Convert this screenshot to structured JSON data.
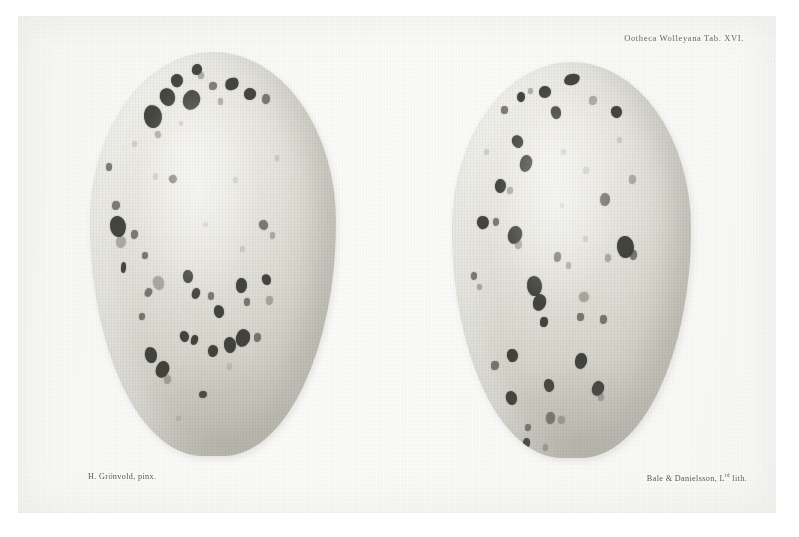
{
  "plate": {
    "title_caption": "Ootheca Wolleyana Tab. XVI.",
    "artist_caption": "H. Grönvold, pinx.",
    "printer_caption_main": "Bale & Danielsson, L",
    "printer_caption_sup": "td",
    "printer_caption_tail": " lith.",
    "background_color": "#ffffff",
    "paper_color": "#f7f7f5",
    "shell_color": "#e4e3dc",
    "spot_color": "#2b2a26"
  },
  "specimens": [
    {
      "name": "egg-left",
      "left": 90,
      "top": 52,
      "width": 246,
      "height": 404,
      "spots": [
        {
          "x": 33.0,
          "y": 5.5,
          "w": 5.0,
          "h": 3.2,
          "r": -18,
          "cls": ""
        },
        {
          "x": 41.5,
          "y": 3.0,
          "w": 4.0,
          "h": 2.6,
          "r": 12,
          "cls": ""
        },
        {
          "x": 28.5,
          "y": 9.0,
          "w": 6.2,
          "h": 4.4,
          "r": -25,
          "cls": ""
        },
        {
          "x": 38.0,
          "y": 9.5,
          "w": 7.0,
          "h": 5.0,
          "r": 15,
          "cls": ""
        },
        {
          "x": 48.5,
          "y": 7.5,
          "w": 3.0,
          "h": 2.0,
          "r": 0,
          "cls": "mid"
        },
        {
          "x": 22.0,
          "y": 13.0,
          "w": 7.5,
          "h": 5.8,
          "r": -10,
          "cls": ""
        },
        {
          "x": 55.0,
          "y": 6.5,
          "w": 5.5,
          "h": 3.0,
          "r": -22,
          "cls": "streak"
        },
        {
          "x": 62.5,
          "y": 9.0,
          "w": 5.0,
          "h": 3.0,
          "r": 8,
          "cls": ""
        },
        {
          "x": 70.0,
          "y": 10.5,
          "w": 3.2,
          "h": 2.4,
          "r": 0,
          "cls": "mid"
        },
        {
          "x": 44.0,
          "y": 5.0,
          "w": 2.2,
          "h": 1.6,
          "r": 0,
          "cls": "soft"
        },
        {
          "x": 52.0,
          "y": 11.5,
          "w": 2.0,
          "h": 1.5,
          "r": 0,
          "cls": "soft"
        },
        {
          "x": 36.0,
          "y": 17.0,
          "w": 2.0,
          "h": 1.4,
          "r": 0,
          "cls": "faint"
        },
        {
          "x": 26.5,
          "y": 19.5,
          "w": 2.6,
          "h": 1.8,
          "r": -20,
          "cls": "soft"
        },
        {
          "x": 6.5,
          "y": 27.5,
          "w": 2.6,
          "h": 2.0,
          "r": 0,
          "cls": "mid"
        },
        {
          "x": 75.0,
          "y": 25.5,
          "w": 2.0,
          "h": 1.6,
          "r": 0,
          "cls": "faint"
        },
        {
          "x": 9.0,
          "y": 37.0,
          "w": 3.0,
          "h": 2.2,
          "r": 0,
          "cls": "mid"
        },
        {
          "x": 8.0,
          "y": 40.5,
          "w": 6.5,
          "h": 5.2,
          "r": -12,
          "cls": ""
        },
        {
          "x": 10.5,
          "y": 45.5,
          "w": 4.0,
          "h": 3.0,
          "r": 0,
          "cls": "soft"
        },
        {
          "x": 16.5,
          "y": 44.0,
          "w": 3.0,
          "h": 2.4,
          "r": 0,
          "cls": "mid"
        },
        {
          "x": 25.5,
          "y": 30.0,
          "w": 2.0,
          "h": 1.6,
          "r": 0,
          "cls": "faint"
        },
        {
          "x": 32.0,
          "y": 30.5,
          "w": 3.2,
          "h": 2.0,
          "r": -30,
          "cls": "mid"
        },
        {
          "x": 58.0,
          "y": 31.0,
          "w": 2.0,
          "h": 1.5,
          "r": 0,
          "cls": "faint"
        },
        {
          "x": 68.5,
          "y": 41.5,
          "w": 3.6,
          "h": 2.4,
          "r": -35,
          "cls": "mid"
        },
        {
          "x": 73.0,
          "y": 44.5,
          "w": 2.2,
          "h": 1.8,
          "r": 0,
          "cls": "soft"
        },
        {
          "x": 21.0,
          "y": 49.5,
          "w": 2.4,
          "h": 1.8,
          "r": 0,
          "cls": "mid"
        },
        {
          "x": 12.5,
          "y": 52.0,
          "w": 2.2,
          "h": 2.6,
          "r": 0,
          "cls": "streak"
        },
        {
          "x": 25.5,
          "y": 55.5,
          "w": 4.4,
          "h": 3.4,
          "r": -20,
          "cls": "soft"
        },
        {
          "x": 22.5,
          "y": 58.5,
          "w": 3.0,
          "h": 2.2,
          "r": 20,
          "cls": "mid"
        },
        {
          "x": 38.0,
          "y": 54.0,
          "w": 4.0,
          "h": 3.2,
          "r": -8,
          "cls": ""
        },
        {
          "x": 41.5,
          "y": 58.5,
          "w": 3.4,
          "h": 2.6,
          "r": 15,
          "cls": ""
        },
        {
          "x": 48.0,
          "y": 59.5,
          "w": 2.6,
          "h": 2.0,
          "r": 0,
          "cls": "mid"
        },
        {
          "x": 50.5,
          "y": 62.5,
          "w": 4.2,
          "h": 3.2,
          "r": -14,
          "cls": ""
        },
        {
          "x": 59.5,
          "y": 56.0,
          "w": 4.4,
          "h": 3.6,
          "r": 0,
          "cls": ""
        },
        {
          "x": 62.5,
          "y": 61.0,
          "w": 2.4,
          "h": 1.8,
          "r": 0,
          "cls": "mid"
        },
        {
          "x": 70.0,
          "y": 55.0,
          "w": 3.8,
          "h": 2.8,
          "r": -28,
          "cls": "streak"
        },
        {
          "x": 71.5,
          "y": 60.5,
          "w": 2.8,
          "h": 2.2,
          "r": 0,
          "cls": "soft"
        },
        {
          "x": 20.0,
          "y": 64.5,
          "w": 2.4,
          "h": 1.8,
          "r": 0,
          "cls": "mid"
        },
        {
          "x": 36.5,
          "y": 69.0,
          "w": 3.6,
          "h": 2.8,
          "r": -18,
          "cls": ""
        },
        {
          "x": 41.0,
          "y": 70.0,
          "w": 3.0,
          "h": 2.4,
          "r": 10,
          "cls": ""
        },
        {
          "x": 48.0,
          "y": 72.5,
          "w": 4.0,
          "h": 3.0,
          "r": 0,
          "cls": ""
        },
        {
          "x": 54.5,
          "y": 70.5,
          "w": 5.0,
          "h": 4.0,
          "r": -10,
          "cls": ""
        },
        {
          "x": 59.5,
          "y": 68.5,
          "w": 5.6,
          "h": 4.4,
          "r": 12,
          "cls": ""
        },
        {
          "x": 66.5,
          "y": 69.5,
          "w": 3.0,
          "h": 2.4,
          "r": 0,
          "cls": "mid"
        },
        {
          "x": 22.5,
          "y": 73.0,
          "w": 5.0,
          "h": 4.0,
          "r": -14,
          "cls": ""
        },
        {
          "x": 27.0,
          "y": 76.5,
          "w": 5.4,
          "h": 4.2,
          "r": 18,
          "cls": ""
        },
        {
          "x": 30.0,
          "y": 80.0,
          "w": 3.0,
          "h": 2.2,
          "r": 0,
          "cls": "soft"
        },
        {
          "x": 44.5,
          "y": 84.0,
          "w": 3.4,
          "h": 1.8,
          "r": -8,
          "cls": "streak"
        },
        {
          "x": 55.5,
          "y": 77.0,
          "w": 2.2,
          "h": 1.8,
          "r": 0,
          "cls": "faint"
        },
        {
          "x": 35.0,
          "y": 90.0,
          "w": 2.0,
          "h": 1.4,
          "r": 0,
          "cls": "faint"
        },
        {
          "x": 61.0,
          "y": 48.0,
          "w": 2.2,
          "h": 1.6,
          "r": 0,
          "cls": "faint"
        },
        {
          "x": 46.0,
          "y": 42.0,
          "w": 1.8,
          "h": 1.4,
          "r": 0,
          "cls": "faint"
        },
        {
          "x": 17.0,
          "y": 22.0,
          "w": 2.0,
          "h": 1.6,
          "r": 0,
          "cls": "faint"
        }
      ]
    },
    {
      "name": "egg-right",
      "left": 452,
      "top": 62,
      "width": 239,
      "height": 396,
      "spots": [
        {
          "x": 47.0,
          "y": 3.0,
          "w": 6.5,
          "h": 2.8,
          "r": -12,
          "cls": "streak"
        },
        {
          "x": 36.5,
          "y": 6.0,
          "w": 5.0,
          "h": 3.0,
          "r": 20,
          "cls": ""
        },
        {
          "x": 27.0,
          "y": 7.5,
          "w": 3.4,
          "h": 2.6,
          "r": 0,
          "cls": ""
        },
        {
          "x": 20.5,
          "y": 11.0,
          "w": 3.0,
          "h": 2.2,
          "r": 0,
          "cls": "mid"
        },
        {
          "x": 41.5,
          "y": 11.0,
          "w": 4.2,
          "h": 3.2,
          "r": -18,
          "cls": ""
        },
        {
          "x": 57.5,
          "y": 8.5,
          "w": 3.2,
          "h": 2.4,
          "r": 0,
          "cls": "soft"
        },
        {
          "x": 66.5,
          "y": 11.0,
          "w": 4.4,
          "h": 3.0,
          "r": -25,
          "cls": ""
        },
        {
          "x": 32.0,
          "y": 6.5,
          "w": 2.0,
          "h": 1.5,
          "r": 0,
          "cls": "soft"
        },
        {
          "x": 25.0,
          "y": 18.5,
          "w": 4.6,
          "h": 3.2,
          "r": -30,
          "cls": ""
        },
        {
          "x": 28.5,
          "y": 23.5,
          "w": 5.2,
          "h": 4.2,
          "r": 10,
          "cls": ""
        },
        {
          "x": 18.0,
          "y": 29.5,
          "w": 4.6,
          "h": 3.6,
          "r": 0,
          "cls": ""
        },
        {
          "x": 23.0,
          "y": 31.5,
          "w": 2.4,
          "h": 1.8,
          "r": 0,
          "cls": "soft"
        },
        {
          "x": 45.5,
          "y": 22.0,
          "w": 2.0,
          "h": 1.6,
          "r": 0,
          "cls": "faint"
        },
        {
          "x": 55.0,
          "y": 26.5,
          "w": 2.2,
          "h": 1.7,
          "r": 0,
          "cls": "faint"
        },
        {
          "x": 62.0,
          "y": 33.0,
          "w": 4.2,
          "h": 3.4,
          "r": 0,
          "cls": "mid"
        },
        {
          "x": 74.0,
          "y": 28.5,
          "w": 3.0,
          "h": 2.2,
          "r": 0,
          "cls": "soft"
        },
        {
          "x": 10.5,
          "y": 39.0,
          "w": 5.0,
          "h": 3.4,
          "r": -15,
          "cls": ""
        },
        {
          "x": 17.0,
          "y": 39.5,
          "w": 2.6,
          "h": 2.0,
          "r": 0,
          "cls": "mid"
        },
        {
          "x": 23.5,
          "y": 41.5,
          "w": 6.0,
          "h": 4.6,
          "r": 12,
          "cls": ""
        },
        {
          "x": 26.5,
          "y": 45.0,
          "w": 3.0,
          "h": 2.2,
          "r": 0,
          "cls": "soft"
        },
        {
          "x": 69.0,
          "y": 44.0,
          "w": 7.0,
          "h": 5.6,
          "r": -8,
          "cls": ""
        },
        {
          "x": 74.5,
          "y": 47.5,
          "w": 3.0,
          "h": 2.4,
          "r": 0,
          "cls": "mid"
        },
        {
          "x": 64.0,
          "y": 48.5,
          "w": 2.6,
          "h": 2.0,
          "r": 0,
          "cls": "soft"
        },
        {
          "x": 42.5,
          "y": 48.0,
          "w": 3.0,
          "h": 2.4,
          "r": 0,
          "cls": "mid"
        },
        {
          "x": 47.5,
          "y": 50.5,
          "w": 2.4,
          "h": 1.8,
          "r": 0,
          "cls": "soft"
        },
        {
          "x": 31.5,
          "y": 54.0,
          "w": 6.4,
          "h": 5.0,
          "r": -10,
          "cls": ""
        },
        {
          "x": 34.0,
          "y": 58.5,
          "w": 5.6,
          "h": 4.4,
          "r": 14,
          "cls": ""
        },
        {
          "x": 53.0,
          "y": 58.0,
          "w": 4.0,
          "h": 2.6,
          "r": -20,
          "cls": "soft"
        },
        {
          "x": 8.0,
          "y": 53.0,
          "w": 2.6,
          "h": 2.0,
          "r": 0,
          "cls": "mid"
        },
        {
          "x": 10.5,
          "y": 56.0,
          "w": 2.0,
          "h": 1.6,
          "r": 0,
          "cls": "soft"
        },
        {
          "x": 37.0,
          "y": 64.5,
          "w": 3.0,
          "h": 2.4,
          "r": 0,
          "cls": ""
        },
        {
          "x": 52.5,
          "y": 63.5,
          "w": 2.6,
          "h": 2.0,
          "r": 0,
          "cls": "mid"
        },
        {
          "x": 62.0,
          "y": 64.0,
          "w": 3.0,
          "h": 2.2,
          "r": 0,
          "cls": "mid"
        },
        {
          "x": 23.0,
          "y": 72.5,
          "w": 4.4,
          "h": 3.4,
          "r": -12,
          "cls": ""
        },
        {
          "x": 16.5,
          "y": 75.5,
          "w": 3.0,
          "h": 2.4,
          "r": 0,
          "cls": "mid"
        },
        {
          "x": 51.5,
          "y": 73.5,
          "w": 5.0,
          "h": 4.0,
          "r": 8,
          "cls": ""
        },
        {
          "x": 38.5,
          "y": 80.0,
          "w": 4.0,
          "h": 3.2,
          "r": -14,
          "cls": ""
        },
        {
          "x": 58.5,
          "y": 80.5,
          "w": 5.0,
          "h": 3.8,
          "r": 16,
          "cls": ""
        },
        {
          "x": 61.0,
          "y": 83.5,
          "w": 2.6,
          "h": 2.0,
          "r": 0,
          "cls": "soft"
        },
        {
          "x": 22.5,
          "y": 83.0,
          "w": 4.6,
          "h": 3.6,
          "r": -18,
          "cls": ""
        },
        {
          "x": 39.5,
          "y": 88.5,
          "w": 3.6,
          "h": 2.8,
          "r": 0,
          "cls": "mid"
        },
        {
          "x": 44.5,
          "y": 89.5,
          "w": 2.6,
          "h": 2.0,
          "r": 0,
          "cls": "soft"
        },
        {
          "x": 30.5,
          "y": 91.5,
          "w": 2.4,
          "h": 1.8,
          "r": 0,
          "cls": "mid"
        },
        {
          "x": 29.5,
          "y": 95.0,
          "w": 3.0,
          "h": 2.4,
          "r": 0,
          "cls": ""
        },
        {
          "x": 38.0,
          "y": 96.5,
          "w": 2.2,
          "h": 1.7,
          "r": 0,
          "cls": "soft"
        },
        {
          "x": 45.0,
          "y": 35.5,
          "w": 1.8,
          "h": 1.4,
          "r": 0,
          "cls": "faint"
        },
        {
          "x": 13.5,
          "y": 22.0,
          "w": 2.0,
          "h": 1.5,
          "r": 0,
          "cls": "faint"
        },
        {
          "x": 69.0,
          "y": 19.0,
          "w": 2.0,
          "h": 1.5,
          "r": 0,
          "cls": "faint"
        },
        {
          "x": 55.0,
          "y": 44.0,
          "w": 1.8,
          "h": 1.4,
          "r": 0,
          "cls": "faint"
        }
      ]
    }
  ]
}
